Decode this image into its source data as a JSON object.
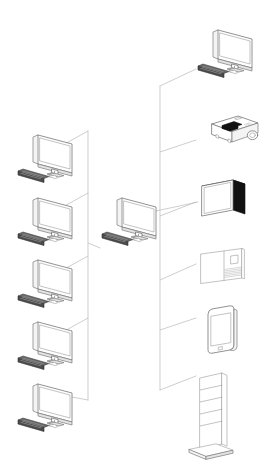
{
  "diagram": {
    "title": "AV and Computer Connectivity Isometric Diagram",
    "style": "isometric line drawing",
    "background_color": "#ffffff",
    "line_color": "#b9b9b9",
    "outline_color": "#6e6e6e",
    "accent_dark_color": "#111111",
    "keyboard_color": "#4b4b4b",
    "canvas": {
      "width": 264,
      "height": 476
    }
  },
  "hub": {
    "name": "central-workstation",
    "label": "Central Workstation",
    "icon": "desktop-computer-icon",
    "position": {
      "x": 104,
      "y": 196
    }
  },
  "left_nodes": [
    {
      "name": "workstation-1",
      "label": "Workstation 1",
      "icon": "desktop-computer-icon",
      "position": {
        "x": 16,
        "y": 133
      }
    },
    {
      "name": "workstation-2",
      "label": "Workstation 2",
      "icon": "desktop-computer-icon",
      "position": {
        "x": 16,
        "y": 196
      }
    },
    {
      "name": "workstation-3",
      "label": "Workstation 3",
      "icon": "desktop-computer-icon",
      "position": {
        "x": 16,
        "y": 258
      }
    },
    {
      "name": "workstation-4",
      "label": "Workstation 4",
      "icon": "desktop-computer-icon",
      "position": {
        "x": 16,
        "y": 320
      }
    },
    {
      "name": "workstation-5",
      "label": "Workstation 5",
      "icon": "desktop-computer-icon",
      "position": {
        "x": 16,
        "y": 382
      }
    }
  ],
  "right_nodes": [
    {
      "name": "remote-monitor",
      "label": "Remote Monitor",
      "icon": "desktop-computer-icon",
      "position": {
        "x": 196,
        "y": 28
      }
    },
    {
      "name": "projector",
      "label": "Projector",
      "icon": "projector-icon",
      "position": {
        "x": 196,
        "y": 112
      }
    },
    {
      "name": "flat-panel-display",
      "label": "Flat Panel Display",
      "icon": "flat-panel-tv-icon",
      "position": {
        "x": 198,
        "y": 178
      }
    },
    {
      "name": "interactive-panel",
      "label": "Interactive Panel",
      "icon": "interactive-whiteboard-icon",
      "position": {
        "x": 198,
        "y": 246
      }
    },
    {
      "name": "tablet-device",
      "label": "Tablet Device",
      "icon": "tablet-icon",
      "position": {
        "x": 200,
        "y": 305
      }
    },
    {
      "name": "floor-stand-kiosk",
      "label": "Floor Stand Kiosk",
      "icon": "floor-stand-icon",
      "position": {
        "x": 186,
        "y": 372
      }
    }
  ],
  "connections": {
    "left_trunk_label": "Left Connection Trunk",
    "right_trunk_label": "Right Connection Trunk",
    "count": 11
  }
}
